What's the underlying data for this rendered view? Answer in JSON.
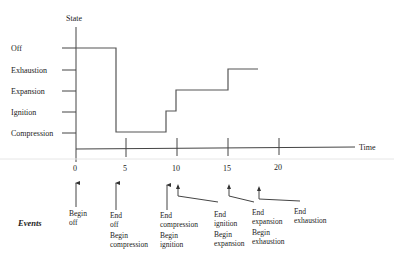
{
  "diagram": {
    "y_axis_label": "State",
    "x_axis_label": "Time",
    "states": [
      "Off",
      "Exhaustion",
      "Expansion",
      "Ignition",
      "Compression"
    ],
    "x_ticks": [
      "0",
      "5",
      "10",
      "15",
      "20"
    ],
    "events_label": "Events",
    "events": [
      {
        "time": 0,
        "lines": [
          "Begin",
          "off"
        ]
      },
      {
        "time": 4,
        "lines": [
          "End",
          "off"
        ],
        "lines2": [
          "Begin",
          "compression"
        ]
      },
      {
        "time": 9,
        "lines": [
          "End",
          "compression"
        ],
        "lines2": [
          "Begin",
          "ignition"
        ]
      },
      {
        "time": 10,
        "lines": [
          "End",
          "ignition"
        ],
        "lines2": [
          "Begin",
          "expansion"
        ]
      },
      {
        "time": 15,
        "lines": [
          "End",
          "expansion"
        ],
        "lines2": [
          "Begin",
          "exhaustion"
        ]
      },
      {
        "time": 18,
        "lines": [
          "End",
          "exhaustion"
        ]
      }
    ],
    "state_path": [
      {
        "state": "Off",
        "from": 0,
        "to": 4
      },
      {
        "state": "Compression",
        "from": 4,
        "to": 9
      },
      {
        "state": "Ignition",
        "from": 9,
        "to": 10
      },
      {
        "state": "Expansion",
        "from": 10,
        "to": 15
      },
      {
        "state": "Exhaustion",
        "from": 15,
        "to": 18
      }
    ]
  }
}
